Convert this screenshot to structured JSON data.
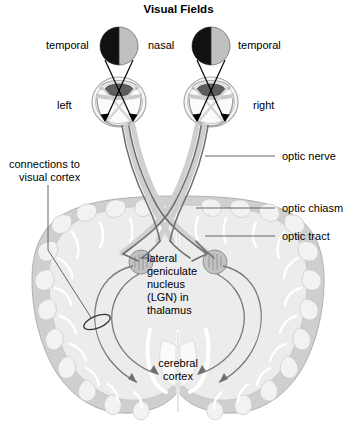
{
  "title": "Visual Fields",
  "diagram": {
    "kind": "visual-pathway-anatomy-diagram",
    "labels": {
      "temporal_left": "temporal",
      "nasal": "nasal",
      "temporal_right": "temporal",
      "eye_left": "left",
      "eye_right": "right",
      "connections_to_visual_cortex": "connections to\nvisual cortex",
      "connections_line_1": "connections to",
      "connections_line_2": "visual cortex",
      "optic_nerve": "optic nerve",
      "optic_chiasm": "optic chiasm",
      "optic_tract": "optic tract",
      "lgn_line_1": "lateral",
      "lgn_line_2": "geniculate",
      "lgn_line_3": "nucleus",
      "lgn_line_4": "(LGN) in",
      "lgn_line_5": "thalamus",
      "cerebral_line_1": "cerebral",
      "cerebral_line_2": "cortex"
    },
    "colors": {
      "field_temporal_half": "#111111",
      "field_nasal_half": "#c0c0c0",
      "brain_white_matter": "#ececec",
      "brain_gray_matter": "#cfcfcf",
      "brain_outline": "#b3b3b3",
      "nerve_stroke": "#8a8a8a",
      "nerve_dark": "#5c5c5c",
      "label_text": "#000000",
      "leader_line": "#555555",
      "eye_fill": "#f4f4f4",
      "eye_outline": "#999999",
      "lens_fill": "#5a5a5a",
      "lgn_fill": "#c2c2c2"
    }
  }
}
